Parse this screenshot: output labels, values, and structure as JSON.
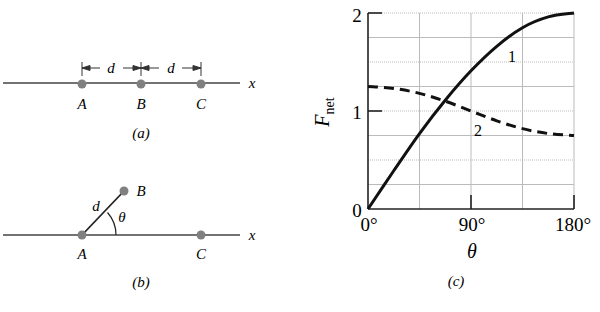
{
  "panels": {
    "a": {
      "caption": "(a)",
      "points": [
        "A",
        "B",
        "C"
      ],
      "axis_label": "x",
      "spacing_label": "d"
    },
    "b": {
      "caption": "(b)",
      "points": [
        "A",
        "B",
        "C"
      ],
      "axis_label": "x",
      "length_label": "d",
      "angle_label": "θ"
    },
    "c": {
      "caption": "(c)"
    }
  },
  "colors": {
    "line": "#444444",
    "dot": "#808080",
    "curve": "#111111",
    "grid": "#bbbbbb"
  },
  "chart_data": {
    "type": "line",
    "title": "",
    "xlabel": "θ",
    "ylabel": "F_net",
    "ylabel_main": "F",
    "ylabel_sub": "net",
    "xlim": [
      0,
      180
    ],
    "ylim": [
      0,
      2
    ],
    "x_ticks": [
      "0°",
      "90°",
      "180°"
    ],
    "y_ticks": [
      "0",
      "1",
      "2"
    ],
    "grid": true,
    "x": [
      0,
      22.5,
      45,
      67.5,
      90,
      112.5,
      135,
      157.5,
      180
    ],
    "series": [
      {
        "name": "1",
        "style": "solid",
        "values": [
          0,
          0.39,
          0.77,
          1.11,
          1.41,
          1.66,
          1.85,
          1.96,
          2.0
        ]
      },
      {
        "name": "2",
        "style": "dashed",
        "values": [
          1.25,
          1.23,
          1.18,
          1.1,
          1.0,
          0.9,
          0.82,
          0.77,
          0.75
        ]
      }
    ]
  }
}
